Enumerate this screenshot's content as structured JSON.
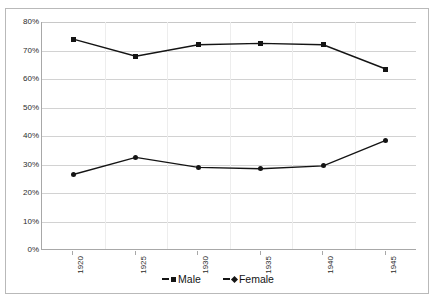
{
  "chart_data": {
    "type": "line",
    "title": "",
    "xlabel": "",
    "ylabel": "",
    "categories": [
      "1920",
      "1925",
      "1930",
      "1935",
      "1940",
      "1945"
    ],
    "series": [
      {
        "name": "Male",
        "marker": "square",
        "values": [
          74.0,
          68.0,
          72.0,
          72.5,
          72.0,
          63.5
        ]
      },
      {
        "name": "Female",
        "marker": "diamond",
        "values": [
          26.5,
          32.5,
          29.0,
          28.5,
          29.5,
          38.5
        ]
      }
    ],
    "ylim": [
      0,
      80
    ],
    "ytick_step": 10,
    "ytick_labels": [
      "80%",
      "70%",
      "60%",
      "50%",
      "40%",
      "30%",
      "20%",
      "10%",
      "0%"
    ],
    "ytick_values": [
      80,
      70,
      60,
      50,
      40,
      30,
      20,
      10,
      0
    ],
    "grid": true,
    "grid_axis": "y",
    "legend_position": "bottom",
    "series_color": "#141414",
    "grid_color": "#d2d2d2",
    "axis_color": "#a8a8a8",
    "background": "#ffffff",
    "x_label_rotation": -90
  },
  "legend": {
    "entries": [
      {
        "label": "Male",
        "marker": "square"
      },
      {
        "label": "Female",
        "marker": "diamond"
      }
    ]
  }
}
